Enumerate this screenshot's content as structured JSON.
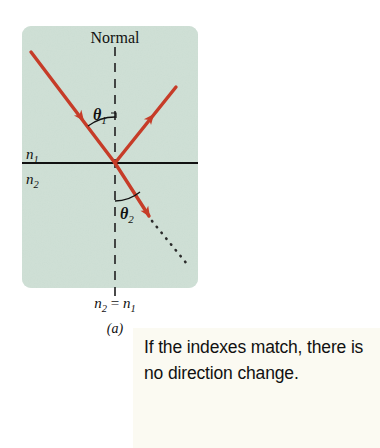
{
  "figure": {
    "panel_label": "(a)",
    "normal_label": "Normal",
    "medium_above_label": "n₁",
    "medium_below_label": "n₂",
    "angle_incidence_label": "θ₁",
    "angle_refraction_label": "θ₂",
    "condition_label": "n₂ = n₁",
    "annotation_lines": [
      "If the indexes match,",
      "there is no direction",
      "change."
    ],
    "annotation_text": "If the indexes match, there is no direction change."
  },
  "colors": {
    "panel_background": "#cfe0d6",
    "ray": "#c63c28",
    "interface_line": "#111111",
    "normal_line": "#2b2b2b",
    "annotation_background": "#fbfaf2",
    "page_background": "#ffffff",
    "text": "#111111"
  },
  "geometry": {
    "panel": {
      "x": 22,
      "y": 26,
      "width": 176,
      "height": 262,
      "corner_radius": 9
    },
    "origin": {
      "x": 115,
      "y": 163
    },
    "normal_line": {
      "x": 115,
      "y_top": 47,
      "y_bottom": 296
    },
    "interface_line": {
      "x_start": 22,
      "x_end": 198,
      "y": 163
    },
    "incident_ray": {
      "x1": 31,
      "y1": 52,
      "x2": 115,
      "y2": 163,
      "arrow_at": 0.62
    },
    "reflected_ray": {
      "x1": 115,
      "y1": 163,
      "x2": 176,
      "y2": 87,
      "arrow_at": 0.63
    },
    "refracted_ray": {
      "x1": 115,
      "y1": 163,
      "x2": 149,
      "y2": 216
    },
    "refracted_dotted": {
      "x1": 149,
      "y1": 216,
      "x2": 186,
      "y2": 263
    }
  },
  "icons": {
    "incident_arrowhead": "arrowhead-down-right-icon",
    "reflected_arrowhead": "arrowhead-up-right-icon",
    "refracted_arrowhead": "arrowhead-down-right-icon"
  }
}
